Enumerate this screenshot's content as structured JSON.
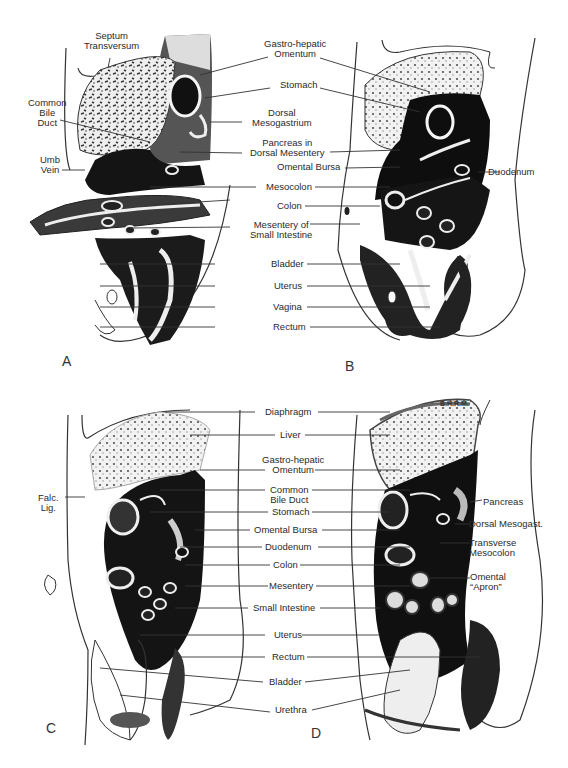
{
  "figure": {
    "panels": [
      {
        "letter": "A"
      },
      {
        "letter": "B"
      },
      {
        "letter": "C"
      },
      {
        "letter": "D"
      }
    ],
    "top_labels": {
      "septum_transversum": [
        "Septum",
        "Transversum"
      ],
      "common_bile_duct": [
        "Common",
        "Bile",
        "Duct"
      ],
      "umb_vein": [
        "Umb",
        "Vein"
      ],
      "gastro_hepatic_omentum": [
        "Gastro-hepatic",
        "Omentum"
      ],
      "stomach": "Stomach",
      "dorsal_mesogastrium": [
        "Dorsal",
        "Mesogastrium"
      ],
      "pancreas_dorsal_mesentery": [
        "Pancreas in",
        "Dorsal Mesentery"
      ],
      "omental_bursa": "Omental Bursa",
      "duodenum": "Duodenum",
      "mesocolon": "Mesocolon",
      "colon": "Colon",
      "mesentery_small_intestine": [
        "Mesentery of",
        "Small Intestine"
      ],
      "bladder": "Bladder",
      "uterus": "Uterus",
      "vagina": "Vagina",
      "rectum": "Rectum"
    },
    "bottom_labels": {
      "falc_lig": [
        "Falc.",
        "Lig."
      ],
      "diaphragm": "Diaphragm",
      "liver": "Liver",
      "gastro_hepatic_omentum": [
        "Gastro-hepatic",
        "Omentum"
      ],
      "common_bile_duct": [
        "Common",
        "Bile Duct"
      ],
      "stomach": "Stomach",
      "omental_bursa": "Omental Bursa",
      "duodenum": "Duodenum",
      "colon": "Colon",
      "mesentery": "Mesentery",
      "small_intestine": "Small Intestine",
      "uterus": "Uterus",
      "rectum": "Rectum",
      "bladder": "Bladder",
      "urethra": "Urethra",
      "pancreas": "Pancreas",
      "dorsal_mesogast": "Dorsal Mesogast.",
      "transverse_mesocolon": [
        "Transverse",
        "Mesocolon"
      ],
      "omental_apron": [
        "Omental",
        "“Apron”"
      ],
      "signature": "B.H.R.M."
    }
  }
}
